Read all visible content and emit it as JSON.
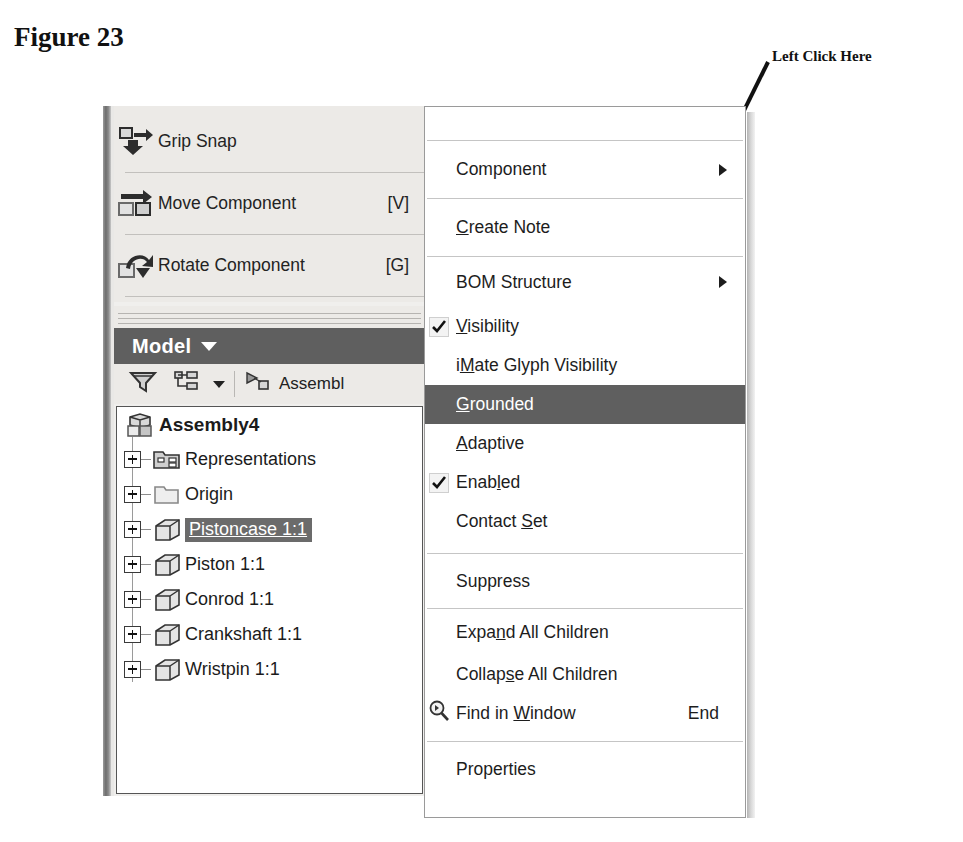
{
  "figure": {
    "title": "Figure 23"
  },
  "callout": {
    "label": "Left Click Here",
    "arrow_icon": "arrow-pointer-icon"
  },
  "panel": {
    "tools": [
      {
        "label": "Grip Snap",
        "shortcut": "",
        "icon": "grip-snap-icon"
      },
      {
        "label": "Move Component",
        "shortcut": "[V]",
        "icon": "move-component-icon"
      },
      {
        "label": "Rotate Component",
        "shortcut": "[G]",
        "icon": "rotate-component-icon"
      }
    ],
    "tab": {
      "label": "Model",
      "caret_icon": "chevron-down-icon"
    },
    "filterbar": {
      "filter_icon": "funnel-filter-icon",
      "tree_view_icon": "tree-view-icon",
      "tree_view_caret_icon": "chevron-down-icon",
      "assembly_icon": "assembly-view-icon",
      "assembly_label": "Assembl"
    },
    "tree": {
      "root": {
        "label": "Assembly4",
        "icon": "assembly-cube-icon"
      },
      "items": [
        {
          "label": "Representations",
          "icon": "representations-folder-icon",
          "selected": false
        },
        {
          "label": "Origin",
          "icon": "folder-icon",
          "selected": false
        },
        {
          "label": "Pistoncase 1:1",
          "icon": "part-cube-icon",
          "selected": true
        },
        {
          "label": "Piston 1:1",
          "icon": "part-cube-icon",
          "selected": false
        },
        {
          "label": "Conrod 1:1",
          "icon": "part-cube-icon",
          "selected": false
        },
        {
          "label": "Crankshaft 1:1",
          "icon": "part-cube-icon",
          "selected": false
        },
        {
          "label": "Wristpin 1:1",
          "icon": "part-cube-icon",
          "selected": false
        }
      ]
    }
  },
  "context_menu": {
    "clipped_top_label": "",
    "items": [
      {
        "label": "Component",
        "accel": "",
        "checked": false,
        "submenu": true,
        "accel_key": "",
        "highlighted": false
      },
      {
        "label": "Create Note",
        "accel": "",
        "checked": false,
        "submenu": false,
        "accel_key": "C",
        "highlighted": false
      },
      {
        "label": "BOM Structure",
        "accel": "",
        "checked": false,
        "submenu": true,
        "accel_key": "",
        "highlighted": false
      },
      {
        "label": "Visibility",
        "accel": "",
        "checked": true,
        "submenu": false,
        "accel_key": "V",
        "highlighted": false
      },
      {
        "label": "iMate Glyph Visibility",
        "accel": "",
        "checked": false,
        "submenu": false,
        "accel_key": "M",
        "highlighted": false
      },
      {
        "label": "Grounded",
        "accel": "",
        "checked": false,
        "submenu": false,
        "accel_key": "G",
        "highlighted": true
      },
      {
        "label": "Adaptive",
        "accel": "",
        "checked": false,
        "submenu": false,
        "accel_key": "A",
        "highlighted": false
      },
      {
        "label": "Enabled",
        "accel": "",
        "checked": true,
        "submenu": false,
        "accel_key": "l",
        "highlighted": false
      },
      {
        "label": "Contact Set",
        "accel": "",
        "checked": false,
        "submenu": false,
        "accel_key": "S",
        "highlighted": false
      },
      {
        "label": "Suppress",
        "accel": "",
        "checked": false,
        "submenu": false,
        "accel_key": "",
        "highlighted": false
      },
      {
        "label": "Expand All Children",
        "accel": "",
        "checked": false,
        "submenu": false,
        "accel_key": "d",
        "highlighted": false
      },
      {
        "label": "Collapse All Children",
        "accel": "",
        "checked": false,
        "submenu": false,
        "accel_key": "s",
        "highlighted": false
      },
      {
        "label": "Find in Window",
        "accel": "End",
        "checked": false,
        "submenu": false,
        "accel_key": "W",
        "highlighted": false,
        "icon": "find-magnifier-icon"
      },
      {
        "label": "Properties",
        "accel": "",
        "checked": false,
        "submenu": false,
        "accel_key": "",
        "highlighted": false
      }
    ],
    "labels": {
      "component": "Component",
      "create_note": "Create Note",
      "bom_structure": "BOM Structure",
      "visibility": "Visibility",
      "imate_glyph_visibility": "iMate Glyph Visibility",
      "grounded": "Grounded",
      "adaptive": "Adaptive",
      "enabled": "Enabled",
      "contact_set": "Contact Set",
      "suppress": "Suppress",
      "expand_all_children": "Expand All Children",
      "collapse_all_children": "Collapse All Children",
      "find_in_window": "Find in Window",
      "find_in_window_accel": "End",
      "properties": "Properties"
    }
  },
  "colors": {
    "menu_highlight": "#5f5f5f",
    "tab_bar": "#5f5f5f",
    "panel_bg": "#eceae7",
    "tree_selection": "#6b6b6b"
  }
}
